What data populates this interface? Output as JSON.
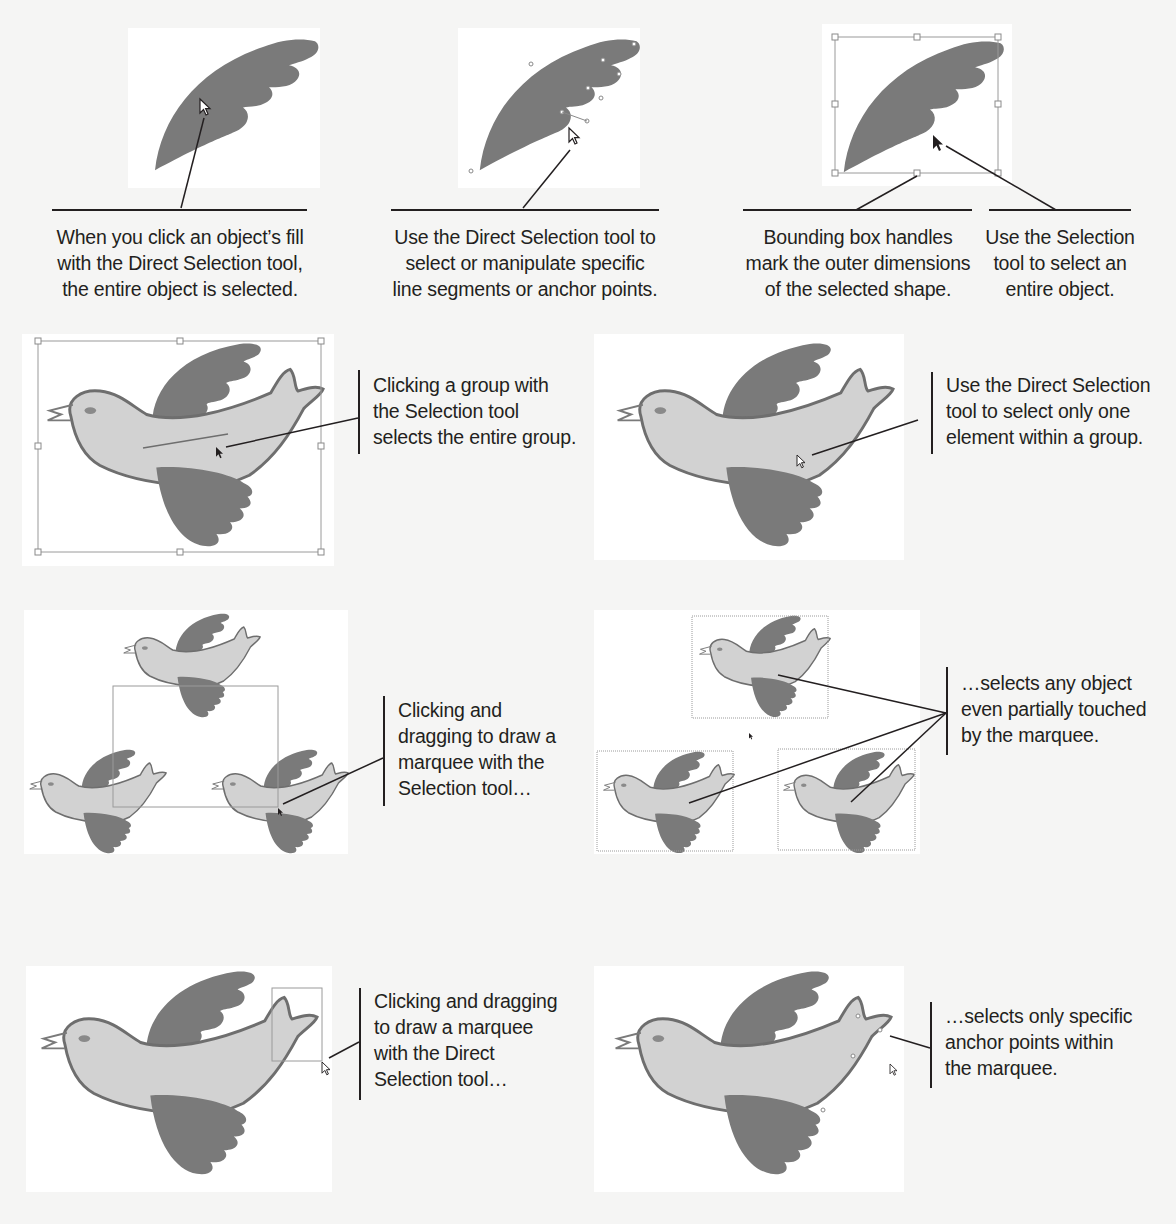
{
  "page": {
    "background": "#f5f5f4",
    "colors": {
      "wing_fill": "#7a7a7a",
      "body_fill": "#d2d2d2",
      "outline": "#6e6e6e",
      "bounding_box": "#9a9a9a",
      "leader_line": "#231f20",
      "text": "#231f20"
    }
  },
  "row1": {
    "captions": [
      {
        "id": "direct-fill",
        "lines": [
          "When you click an object’s fill",
          "with the Direct Selection tool,",
          "the entire object is selected."
        ]
      },
      {
        "id": "direct-segments",
        "lines": [
          "Use the Direct Selection tool to",
          "select or manipulate specific",
          "line segments or anchor points."
        ]
      },
      {
        "id": "bounding-box",
        "lines": [
          "Bounding box handles",
          "mark the outer dimensions",
          "of the selected shape."
        ]
      },
      {
        "id": "selection-tool",
        "lines": [
          "Use the Selection",
          "tool to select an",
          "entire object."
        ]
      }
    ]
  },
  "row2": {
    "captions": [
      {
        "id": "group-selection",
        "lines": [
          "Clicking a group with",
          "the Selection tool",
          "selects the entire group."
        ]
      },
      {
        "id": "group-direct",
        "lines": [
          "Use the Direct Selection",
          "tool to select only one",
          "element within a group."
        ]
      }
    ]
  },
  "row3": {
    "captions": [
      {
        "id": "marquee-selection",
        "lines": [
          "Clicking and",
          "dragging to draw a",
          "marquee with the",
          "Selection tool…"
        ]
      },
      {
        "id": "marquee-selection-result",
        "lines": [
          "…selects any object",
          "even partially touched",
          "by the marquee."
        ]
      }
    ]
  },
  "row4": {
    "captions": [
      {
        "id": "marquee-direct",
        "lines": [
          "Clicking and dragging",
          "to draw a marquee",
          "with the Direct",
          "Selection tool…"
        ]
      },
      {
        "id": "marquee-direct-result",
        "lines": [
          "…selects only specific",
          "anchor points within",
          "the marquee."
        ]
      }
    ]
  },
  "icons": {
    "direct-selection-cursor": "hollow-arrow-cursor",
    "selection-cursor": "solid-arrow-cursor"
  }
}
